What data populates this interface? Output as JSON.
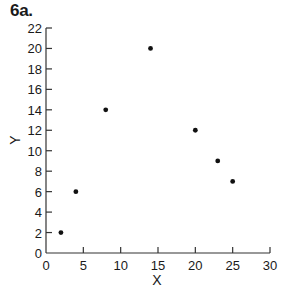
{
  "title": "6a.",
  "chart_data": {
    "type": "scatter",
    "title": "6a.",
    "xlabel": "X",
    "ylabel": "Y",
    "xlim": [
      0,
      30
    ],
    "ylim": [
      0,
      22
    ],
    "xticks": [
      0,
      5,
      10,
      15,
      20,
      25,
      30
    ],
    "yticks": [
      0,
      2,
      4,
      6,
      8,
      10,
      12,
      14,
      16,
      18,
      20,
      22
    ],
    "grid": false,
    "legend": null,
    "points": [
      {
        "x": 2,
        "y": 2
      },
      {
        "x": 4,
        "y": 6
      },
      {
        "x": 8,
        "y": 14
      },
      {
        "x": 14,
        "y": 20
      },
      {
        "x": 20,
        "y": 12
      },
      {
        "x": 23,
        "y": 9
      },
      {
        "x": 25,
        "y": 7
      }
    ],
    "marker_color": "#111111"
  }
}
